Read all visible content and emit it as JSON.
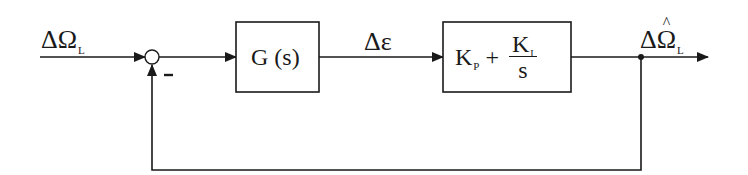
{
  "diagram": {
    "type": "control-loop-block-diagram",
    "input_signal": {
      "symbol": "ΔΩ",
      "subscript": "L"
    },
    "summing_junction": {
      "feedback_sign": "-"
    },
    "blocks": [
      {
        "id": "plant",
        "label": "G (s)"
      },
      {
        "id": "pi_controller",
        "kp_symbol": "K",
        "kp_subscript": "P",
        "plus": "+",
        "ki_symbol": "K",
        "ki_subscript": "I",
        "denominator": "s"
      }
    ],
    "intermediate_signal": {
      "symbol": "Δε"
    },
    "output_signal": {
      "symbol": "ΔΩ̂",
      "base": "ΔΩ",
      "subscript": "L"
    },
    "feedback": "unity negative feedback from output to summing junction",
    "colors": {
      "line": "#1a1a1a",
      "background": "#ffffff"
    }
  }
}
